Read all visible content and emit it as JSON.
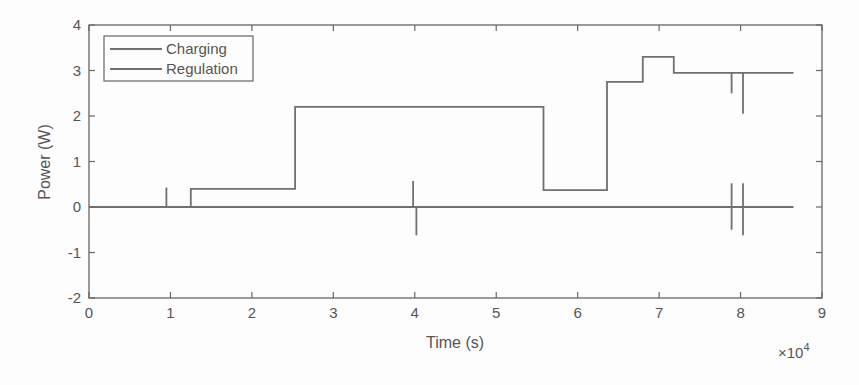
{
  "chart_data": {
    "type": "line",
    "title": "",
    "xlabel": "Time (s)",
    "ylabel": "Power (W)",
    "x_multiplier_label": "×10",
    "x_multiplier_exp": "4",
    "xlim": [
      0,
      90000
    ],
    "ylim": [
      -2,
      4
    ],
    "xticks": [
      0,
      1,
      2,
      3,
      4,
      5,
      6,
      7,
      8,
      9
    ],
    "yticks": [
      -2,
      -1,
      0,
      1,
      2,
      3,
      4
    ],
    "grid": false,
    "legend_position": "upper-left",
    "line_color": "#707070",
    "series": [
      {
        "name": "Charging",
        "x": [
          0,
          9500,
          9500,
          9500,
          12500,
          12500,
          25300,
          25300,
          55800,
          55800,
          63600,
          63600,
          68000,
          68000,
          71800,
          71800,
          78900,
          78900,
          78900,
          80300,
          80300,
          80300,
          86500
        ],
        "y": [
          0,
          0,
          0.43,
          0,
          0,
          0.4,
          0.4,
          2.2,
          2.2,
          0.37,
          0.37,
          2.75,
          2.75,
          3.3,
          3.3,
          2.95,
          2.95,
          2.5,
          2.95,
          2.95,
          2.05,
          2.95,
          2.95
        ]
      },
      {
        "name": "Regulation",
        "x": [
          0,
          39800,
          39800,
          39800,
          40200,
          40200,
          40200,
          78900,
          78900,
          78900,
          78900,
          80300,
          80300,
          80300,
          80300,
          86500
        ],
        "y": [
          0,
          0,
          0.57,
          0,
          0,
          -0.62,
          0,
          0,
          0.52,
          -0.5,
          0,
          0,
          0.52,
          -0.62,
          0,
          0
        ]
      }
    ]
  }
}
